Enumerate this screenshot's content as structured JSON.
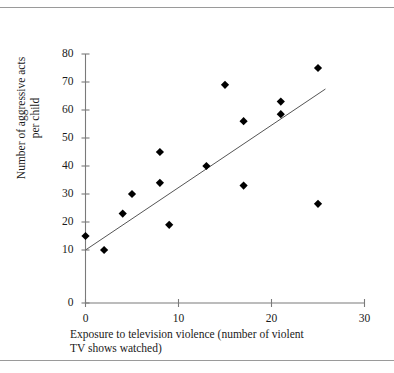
{
  "chart_data": {
    "type": "scatter",
    "title": "",
    "xlabel": "Exposure to television violence (number of violent TV shows watched)",
    "xlabel_line1": "Exposure to television violence (number of violent",
    "xlabel_line2": "TV shows watched)",
    "ylabel": "Number of aggressive acts per child",
    "ylabel_line1": "Number of aggressive acts",
    "ylabel_line2": "per child",
    "xlim": [
      0,
      30
    ],
    "ylim": [
      0,
      80
    ],
    "xticks": [
      0,
      10,
      20,
      30
    ],
    "yticks": [
      0,
      10,
      20,
      30,
      40,
      50,
      60,
      70,
      80
    ],
    "xtick_labels": [
      "0",
      "10",
      "20",
      "30"
    ],
    "ytick_labels": [
      "0",
      "10",
      "20",
      "30",
      "40",
      "50",
      "60",
      "70",
      "80"
    ],
    "grid": false,
    "legend": false,
    "marker": "diamond",
    "marker_color": "#000000",
    "axis_color": "#7a7a7a",
    "trendline_color": "#555555",
    "points": [
      {
        "x": 0,
        "y": 15
      },
      {
        "x": 2,
        "y": 10
      },
      {
        "x": 4,
        "y": 23
      },
      {
        "x": 5,
        "y": 30
      },
      {
        "x": 8,
        "y": 34
      },
      {
        "x": 8,
        "y": 45
      },
      {
        "x": 9,
        "y": 19
      },
      {
        "x": 13,
        "y": 40
      },
      {
        "x": 15,
        "y": 69
      },
      {
        "x": 17,
        "y": 33
      },
      {
        "x": 17,
        "y": 56
      },
      {
        "x": 21,
        "y": 58.5
      },
      {
        "x": 21,
        "y": 63
      },
      {
        "x": 25,
        "y": 26.5
      },
      {
        "x": 25,
        "y": 75
      }
    ],
    "trendline": {
      "x_start": 0,
      "y_start": 10,
      "x_end": 25.8,
      "y_end": 67.5
    }
  }
}
